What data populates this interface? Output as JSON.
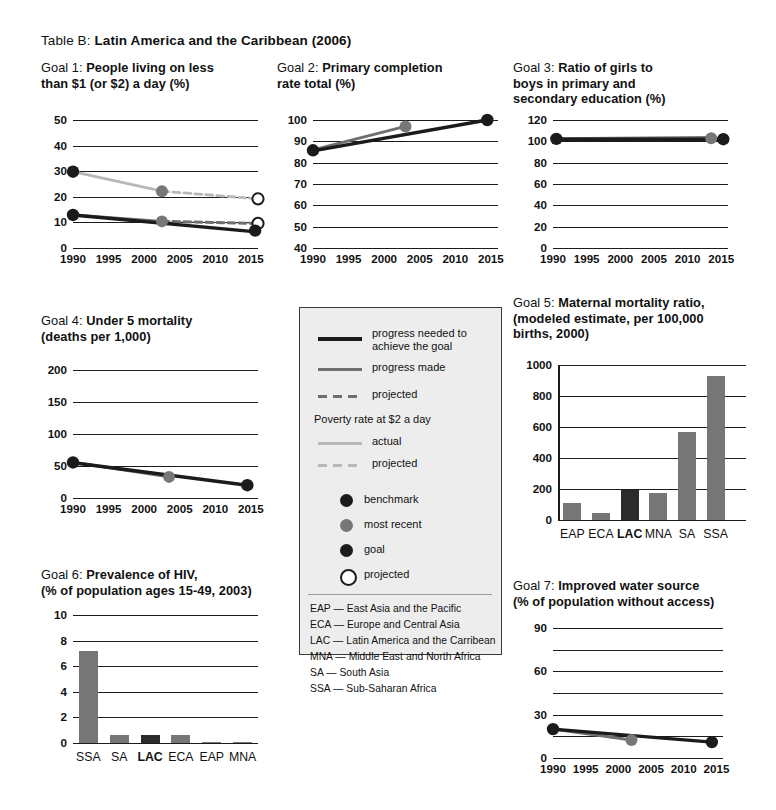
{
  "page": {
    "table_label": "Table B:",
    "table_title": "Latin America and the Caribbean (2006)"
  },
  "colors": {
    "benchmark_dot": "#1b1b1b",
    "goal_dot": "#1b1b1b",
    "most_recent_dot": "#777777",
    "projected_dot_fill": "#ffffff",
    "progress_needed_line": "#1b1b1b",
    "progress_made_line": "#6f6f6f",
    "poverty_actual_line": "#b8b8b8",
    "poverty_projected_line": "#b8b8b8",
    "bar_fill": "#767676",
    "bar_highlight": "#2b2b2b",
    "legend_background": "#ededed",
    "legend_border": "#3a3a3a",
    "gridline": "#1b1b1b"
  },
  "legend": {
    "items": [
      {
        "name": "progress-needed",
        "label": "progress needed to\nachieve the goal",
        "style": "solid-black-thick"
      },
      {
        "name": "progress-made",
        "label": "progress made",
        "style": "solid-gray"
      },
      {
        "name": "projected",
        "label": "projected",
        "style": "dashed-gray"
      }
    ],
    "poverty_heading": "Poverty rate at $2 a day",
    "poverty_items": [
      {
        "name": "poverty-actual",
        "label": "actual",
        "style": "solid-light"
      },
      {
        "name": "poverty-projected",
        "label": "projected",
        "style": "dashed-light"
      }
    ],
    "markers": [
      {
        "name": "benchmark",
        "label": "benchmark",
        "fill": "#1b1b1b"
      },
      {
        "name": "most-recent",
        "label": "most recent",
        "fill": "#777777"
      },
      {
        "name": "goal",
        "label": "goal",
        "fill": "#1b1b1b"
      },
      {
        "name": "projected",
        "label": "projected",
        "fill": "#ffffff"
      }
    ],
    "abbreviations": [
      "EAP — East Asia and the Pacific",
      "ECA — Europe and Central Asia",
      "LAC — Latin America and the Carribean",
      "MNA — Middle East and North Africa",
      "SA — South Asia",
      "SSA — Sub-Saharan Africa"
    ]
  },
  "chart_data": [
    {
      "id": "goal1",
      "type": "line",
      "goal_label": "Goal 1:",
      "title": "People living on less\nthan $1 (or $2) a day (%)",
      "xlabel": "",
      "ylabel": "",
      "ylim": [
        0,
        50
      ],
      "yticks": [
        0,
        10,
        20,
        30,
        40,
        50
      ],
      "xlim": [
        1990,
        2016
      ],
      "xticks": [
        1990,
        1995,
        2000,
        2005,
        2010,
        2015
      ],
      "grid": true,
      "series": [
        {
          "name": "poverty $2 a day actual",
          "style": "poverty-actual",
          "x": [
            1990,
            2002.5
          ],
          "values": [
            29.8,
            22.2
          ]
        },
        {
          "name": "poverty $2 a day projected",
          "style": "poverty-projected",
          "x": [
            2002.5,
            2016
          ],
          "values": [
            22.2,
            19.2
          ]
        },
        {
          "name": "progress made $1 a day",
          "style": "progress-made",
          "x": [
            1990,
            2002.5
          ],
          "values": [
            12.9,
            10.4
          ]
        },
        {
          "name": "projected $1 a day",
          "style": "projected",
          "x": [
            2002.5,
            2016
          ],
          "values": [
            10.4,
            9.6
          ]
        },
        {
          "name": "progress needed to achieve the goal",
          "style": "progress-needed",
          "x": [
            1990,
            2015
          ],
          "values": [
            12.9,
            6.5
          ]
        }
      ],
      "markers": [
        {
          "kind": "benchmark",
          "x": 1990,
          "y": 29.8
        },
        {
          "kind": "most-recent",
          "x": 2002.5,
          "y": 22.2
        },
        {
          "kind": "projected",
          "x": 2016,
          "y": 19.2
        },
        {
          "kind": "benchmark",
          "x": 1990,
          "y": 12.9
        },
        {
          "kind": "most-recent",
          "x": 2002.5,
          "y": 10.4
        },
        {
          "kind": "projected",
          "x": 2016,
          "y": 9.6
        },
        {
          "kind": "goal",
          "x": 2015.6,
          "y": 6.8
        }
      ]
    },
    {
      "id": "goal2",
      "type": "line",
      "goal_label": "Goal 2:",
      "title": "Primary completion\nrate total (%)",
      "ylim": [
        40,
        100
      ],
      "yticks": [
        40,
        50,
        60,
        70,
        80,
        90,
        100
      ],
      "xlim": [
        1990,
        2016
      ],
      "xticks": [
        1990,
        1995,
        2000,
        2005,
        2010,
        2015
      ],
      "grid": true,
      "series": [
        {
          "name": "progress made",
          "style": "progress-made",
          "x": [
            1990,
            2003
          ],
          "values": [
            86.0,
            97.0
          ]
        },
        {
          "name": "progress needed to achieve the goal",
          "style": "progress-needed",
          "x": [
            1990,
            2014.5
          ],
          "values": [
            85.5,
            100.0
          ]
        }
      ],
      "markers": [
        {
          "kind": "benchmark",
          "x": 1990,
          "y": 85.8
        },
        {
          "kind": "most-recent",
          "x": 2003,
          "y": 97.0
        },
        {
          "kind": "goal",
          "x": 2014.5,
          "y": 100.0
        }
      ]
    },
    {
      "id": "goal3",
      "type": "line",
      "goal_label": "Goal 3:",
      "title": "Ratio of girls to\nboys in primary and\nsecondary education (%)",
      "ylim": [
        0,
        120
      ],
      "yticks": [
        0,
        20,
        40,
        60,
        80,
        100,
        120
      ],
      "xlim": [
        1990,
        2016
      ],
      "xticks": [
        1990,
        1995,
        2000,
        2005,
        2010,
        2015
      ],
      "grid": true,
      "series": [
        {
          "name": "progress made",
          "style": "progress-made",
          "x": [
            1990.5,
            2013.5
          ],
          "values": [
            102.5,
            103.5
          ]
        },
        {
          "name": "progress needed to achieve the goal",
          "style": "progress-needed",
          "x": [
            1990.5,
            2015.3
          ],
          "values": [
            102.0,
            102.0
          ]
        }
      ],
      "markers": [
        {
          "kind": "benchmark",
          "x": 1990.5,
          "y": 102.3
        },
        {
          "kind": "most-recent",
          "x": 2013.5,
          "y": 103.0
        },
        {
          "kind": "goal",
          "x": 2015.3,
          "y": 102.0
        }
      ]
    },
    {
      "id": "goal4",
      "type": "line",
      "goal_label": "Goal 4:",
      "title": "Under 5 mortality\n(deaths per 1,000)",
      "ylim": [
        0,
        200
      ],
      "yticks": [
        0,
        50,
        100,
        150,
        200
      ],
      "xlim": [
        1990,
        2016
      ],
      "xticks": [
        1990,
        1995,
        2000,
        2005,
        2010,
        2015
      ],
      "grid": true,
      "series": [
        {
          "name": "progress made",
          "style": "progress-made",
          "x": [
            1990,
            2003.5
          ],
          "values": [
            56.0,
            33.0
          ]
        },
        {
          "name": "progress needed to achieve the goal",
          "style": "progress-needed",
          "x": [
            1990,
            2014.5
          ],
          "values": [
            55.0,
            20.0
          ]
        }
      ],
      "markers": [
        {
          "kind": "benchmark",
          "x": 1990,
          "y": 55.5
        },
        {
          "kind": "most-recent",
          "x": 2003.5,
          "y": 33.0
        },
        {
          "kind": "goal",
          "x": 2014.5,
          "y": 20.0
        }
      ]
    },
    {
      "id": "goal5",
      "type": "bar",
      "goal_label": "Goal 5:",
      "title": "Maternal mortality ratio,\n(modeled estimate, per 100,000\nbirths, 2000)",
      "categories": [
        "EAP",
        "ECA",
        "LAC",
        "MNA",
        "SA",
        "SSA"
      ],
      "values": [
        110,
        45,
        193,
        175,
        565,
        930
      ],
      "highlight": "LAC",
      "ylim": [
        0,
        1000
      ],
      "yticks": [
        0,
        200,
        400,
        600,
        800,
        1000
      ],
      "grid": true
    },
    {
      "id": "goal6",
      "type": "bar",
      "goal_label": "Goal 6:",
      "title": "Prevalence of HIV,\n(% of population ages 15-49, 2003)",
      "categories": [
        "SSA",
        "SA",
        "LAC",
        "ECA",
        "EAP",
        "MNA"
      ],
      "values": [
        7.2,
        0.65,
        0.6,
        0.6,
        0.1,
        0.02
      ],
      "highlight": "LAC",
      "ylim": [
        0,
        10
      ],
      "yticks": [
        0,
        2,
        4,
        6,
        8,
        10
      ],
      "grid": true
    },
    {
      "id": "goal7",
      "type": "line",
      "goal_label": "Goal 7:",
      "title": "Improved water source\n(% of population without access)",
      "ylim": [
        0,
        90
      ],
      "yticks": [
        0,
        15,
        30,
        45,
        60,
        75,
        90
      ],
      "labeled_yticks": [
        0,
        30,
        60,
        90
      ],
      "xlim": [
        1990,
        2016
      ],
      "xticks": [
        1990,
        1995,
        2000,
        2005,
        2010,
        2015
      ],
      "grid": true,
      "series": [
        {
          "name": "progress made",
          "style": "progress-made",
          "x": [
            1990,
            2002
          ],
          "values": [
            20.0,
            12.5
          ]
        },
        {
          "name": "progress needed to achieve the goal",
          "style": "progress-needed",
          "x": [
            1990,
            2014.3
          ],
          "values": [
            20.0,
            11.0
          ]
        }
      ],
      "markers": [
        {
          "kind": "benchmark",
          "x": 1990,
          "y": 20.0
        },
        {
          "kind": "most-recent",
          "x": 2002,
          "y": 12.5
        },
        {
          "kind": "goal",
          "x": 2014.3,
          "y": 11.0
        }
      ]
    }
  ]
}
